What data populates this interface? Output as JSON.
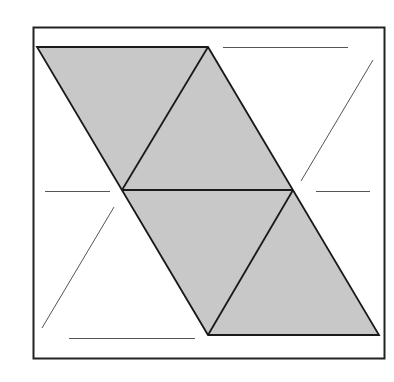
{
  "diagram": {
    "colors": {
      "background": "#ffffff",
      "frame": "#222222",
      "shade": "#c8c8c8",
      "outline": "#1a1a1a",
      "guide": "#555555"
    },
    "shaded_triangles": 4,
    "guide_triangles": 2
  }
}
